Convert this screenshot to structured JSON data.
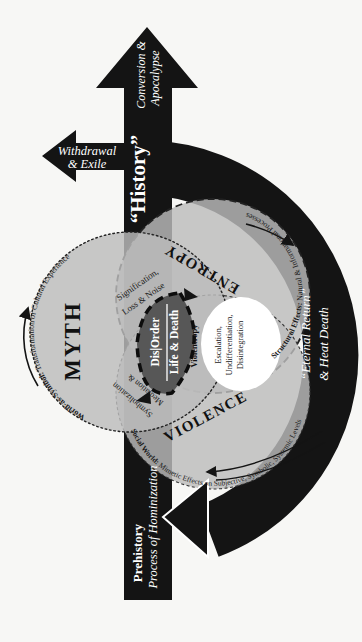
{
  "colors": {
    "ink": "#141414",
    "circle_fill": "#bcbcbc",
    "center_fill": "#575757",
    "background": "#f7f7f5"
  },
  "history_arrow": {
    "label": "“History”",
    "up_branch": {
      "line1": "Conversion &",
      "line2": "Apocalypse"
    },
    "left_branch": {
      "line1": "Withdrawal",
      "line2": "& Exile"
    },
    "origin": {
      "title": "Prehistory",
      "subtitle": "Process of Hominization"
    }
  },
  "cycle_ring": {
    "label_line1": "“Eternal Return”",
    "label_line2": "& Heat Death"
  },
  "venn": {
    "myth": {
      "label": "MYTH",
      "edge_label_bold": "World-as-Symbol: ",
      "edge_label_rest": "Transformation of Cultural Experience"
    },
    "entropy": {
      "label": "ENTROPY",
      "edge_label_bold": "Structural Effects: ",
      "edge_label_rest": "Natural & Informational Processes"
    },
    "violence": {
      "label": "VIOLENCE",
      "edge_label_bold": "Social World: ",
      "edge_label_rest": "Mimetic Effects on Subjective, Symbolic, Systemic Levels"
    },
    "myth_entropy_overlap": {
      "line1": "Signification,",
      "line2": "Loss & Noise"
    },
    "myth_violence_overlap": {
      "line1": "Mediation &",
      "line2": "Symbolization"
    },
    "entropy_violence_overlap": {
      "line1": "Escalation,",
      "line2": "Undifferentiation,",
      "line3": "Disintegration",
      "edge_label": "Violentropy"
    },
    "center": {
      "line1": "Dis|Order",
      "line2": "Life & Death"
    }
  }
}
